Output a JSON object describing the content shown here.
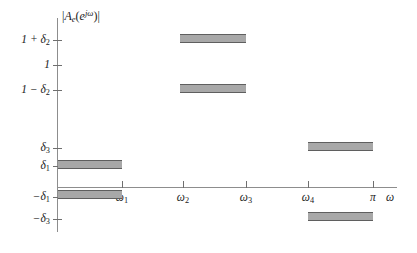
{
  "figure": {
    "axis_title": "|A_e(e^{jω})|",
    "x_axis_title": "ω",
    "accent_bar_fill": "#a8a8a8",
    "accent_bar_edge": "#5f5f5f",
    "axis_color": "#8d8d8d"
  },
  "y_ticks": [
    {
      "label_html": "1 + δ",
      "sub": "2",
      "value": "1+delta2",
      "y": 40
    },
    {
      "label_html": "1",
      "sub": "",
      "value": "1",
      "y": 65
    },
    {
      "label_html": "1 − δ",
      "sub": "2",
      "value": "1-delta2",
      "y": 90
    },
    {
      "label_html": "δ",
      "sub": "3",
      "value": "delta3",
      "y": 148
    },
    {
      "label_html": "δ",
      "sub": "1",
      "value": "delta1",
      "y": 166
    },
    {
      "label_html": "−δ",
      "sub": "1",
      "value": "-delta1",
      "y": 197
    },
    {
      "label_html": "−δ",
      "sub": "3",
      "value": "-delta3",
      "y": 219
    }
  ],
  "x_ticks": [
    {
      "label_html": "ω",
      "sub": "1",
      "value": "omega1",
      "x": 122
    },
    {
      "label_html": "ω",
      "sub": "2",
      "value": "omega2",
      "x": 183
    },
    {
      "label_html": "ω",
      "sub": "3",
      "value": "omega3",
      "x": 246
    },
    {
      "label_html": "ω",
      "sub": "4",
      "value": "omega4",
      "x": 308
    },
    {
      "label_html": "π",
      "sub": "",
      "value": "pi",
      "x": 373
    }
  ],
  "bands": [
    {
      "name": "passband-low-upper",
      "x1": 58,
      "x2": 122,
      "y": 160,
      "h": 9
    },
    {
      "name": "passband-low-lower",
      "x1": 58,
      "x2": 122,
      "y": 190,
      "h": 9
    },
    {
      "name": "passband-mid-upper",
      "x1": 180,
      "x2": 246,
      "y": 34,
      "h": 9
    },
    {
      "name": "passband-mid-lower",
      "x1": 180,
      "x2": 246,
      "y": 84,
      "h": 9
    },
    {
      "name": "stopband-high-upper",
      "x1": 308,
      "x2": 373,
      "y": 142,
      "h": 9
    },
    {
      "name": "stopband-high-lower",
      "x1": 308,
      "x2": 373,
      "y": 212,
      "h": 9
    }
  ],
  "chart_data": {
    "type": "area",
    "title": "",
    "xlabel": "ω",
    "ylabel": "|A_e(e^{jω})|",
    "grid": false,
    "legend": "none",
    "xlim": [
      "0",
      "ω axis beyond π"
    ],
    "x_tick_labels": [
      "ω₁",
      "ω₂",
      "ω₃",
      "ω₄",
      "π"
    ],
    "y_tick_labels": [
      "1 + δ₂",
      "1",
      "1 − δ₂",
      "δ₃",
      "δ₁",
      "−δ₁",
      "−δ₃"
    ],
    "tolerance_bands": [
      {
        "name": "stopband 1",
        "x_range": [
          "0",
          "ω₁"
        ],
        "upper_level": "δ₁",
        "lower_level": "−δ₁",
        "description": "Amplitude constrained between −δ₁ and +δ₁"
      },
      {
        "name": "passband",
        "x_range": [
          "ω₂",
          "ω₃"
        ],
        "upper_level": "1 + δ₂",
        "lower_level": "1 − δ₂",
        "description": "Amplitude constrained between 1 − δ₂ and 1 + δ₂"
      },
      {
        "name": "stopband 2",
        "x_range": [
          "ω₄",
          "π"
        ],
        "upper_level": "δ₃",
        "lower_level": "−δ₃",
        "description": "Amplitude constrained between −δ₃ and +δ₃"
      }
    ],
    "transition_bands": [
      {
        "x_range": [
          "ω₁",
          "ω₂"
        ],
        "unconstrained": true
      },
      {
        "x_range": [
          "ω₃",
          "ω₄"
        ],
        "unconstrained": true
      }
    ]
  }
}
